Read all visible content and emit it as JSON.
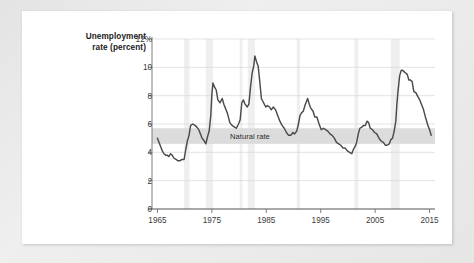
{
  "figure": {
    "y_axis_title_line1": "Unemployment",
    "y_axis_title_line2": "rate (percent)",
    "natural_rate_label": "Natural rate"
  },
  "colors": {
    "page_background": "#e9e9e9",
    "card_background": "#ffffff",
    "line": "#4a4a4a",
    "gridline": "#d8d8d8",
    "axis": "#6f6f6f",
    "natural_rate_band": "#dcdcdc",
    "recession_band": "#efefef",
    "tick_text": "#3c3c3c",
    "title_text": "#1a1a1a"
  },
  "chart_data": {
    "type": "line",
    "title": "",
    "subtitle": "",
    "xlabel": "",
    "ylabel": "Unemployment rate (percent)",
    "xlim": [
      1964,
      2016
    ],
    "ylim": [
      0,
      12
    ],
    "grid": true,
    "legend_position": "none",
    "y_ticks": [
      0,
      2,
      4,
      6,
      8,
      10,
      12
    ],
    "y_tick_labels": [
      "0",
      "2",
      "4",
      "6",
      "8",
      "10",
      "12%"
    ],
    "x_ticks": [
      1965,
      1975,
      1985,
      1995,
      2005,
      2015
    ],
    "x_tick_labels": [
      "1965",
      "1975",
      "1985",
      "1995",
      "2005",
      "2015"
    ],
    "annotations": [
      {
        "text": "Natural rate",
        "x": 1982.0,
        "y": 5.15,
        "kind": "band-label"
      }
    ],
    "bands": {
      "natural_rate": {
        "y_low": 4.6,
        "y_high": 5.7,
        "label": "Natural rate"
      },
      "recessions": [
        {
          "start": 1969.9,
          "end": 1970.9
        },
        {
          "start": 1973.9,
          "end": 1975.2
        },
        {
          "start": 1980.1,
          "end": 1980.6
        },
        {
          "start": 1981.6,
          "end": 1982.9
        },
        {
          "start": 1990.6,
          "end": 1991.2
        },
        {
          "start": 2001.2,
          "end": 2001.9
        },
        {
          "start": 2007.9,
          "end": 2009.5
        }
      ]
    },
    "series": [
      {
        "name": "Unemployment rate",
        "x": [
          1965.0,
          1965.3,
          1965.6,
          1965.9,
          1966.2,
          1966.5,
          1966.8,
          1967.1,
          1967.4,
          1967.7,
          1968.0,
          1968.4,
          1968.8,
          1969.1,
          1969.5,
          1969.9,
          1970.2,
          1970.5,
          1970.8,
          1971.1,
          1971.5,
          1971.9,
          1972.2,
          1972.6,
          1972.9,
          1973.2,
          1973.6,
          1973.9,
          1974.2,
          1974.5,
          1974.8,
          1975.0,
          1975.2,
          1975.5,
          1975.8,
          1976.1,
          1976.5,
          1976.9,
          1977.2,
          1977.6,
          1977.9,
          1978.3,
          1978.7,
          1979.1,
          1979.5,
          1979.9,
          1980.2,
          1980.5,
          1980.8,
          1981.1,
          1981.5,
          1981.8,
          1982.1,
          1982.4,
          1982.7,
          1982.9,
          1983.2,
          1983.5,
          1983.8,
          1984.1,
          1984.5,
          1984.9,
          1985.2,
          1985.6,
          1985.9,
          1986.3,
          1986.7,
          1987.1,
          1987.5,
          1987.9,
          1988.3,
          1988.7,
          1989.1,
          1989.5,
          1989.9,
          1990.2,
          1990.6,
          1990.9,
          1991.2,
          1991.5,
          1991.8,
          1992.1,
          1992.4,
          1992.6,
          1992.9,
          1993.2,
          1993.6,
          1993.9,
          1994.3,
          1994.7,
          1995.1,
          1995.5,
          1995.9,
          1996.3,
          1996.7,
          1997.1,
          1997.5,
          1997.9,
          1998.3,
          1998.7,
          1999.1,
          1999.5,
          1999.9,
          2000.3,
          2000.7,
          2001.0,
          2001.3,
          2001.6,
          2001.9,
          2002.2,
          2002.6,
          2002.9,
          2003.2,
          2003.5,
          2003.8,
          2004.1,
          2004.5,
          2004.9,
          2005.3,
          2005.7,
          2006.1,
          2006.5,
          2006.9,
          2007.2,
          2007.6,
          2007.9,
          2008.2,
          2008.5,
          2008.8,
          2009.0,
          2009.2,
          2009.5,
          2009.8,
          2010.0,
          2010.3,
          2010.6,
          2010.9,
          2011.2,
          2011.5,
          2011.8,
          2012.1,
          2012.5,
          2012.9,
          2013.2,
          2013.6,
          2013.9,
          2014.3,
          2014.7,
          2015.0,
          2015.3
        ],
        "y": [
          5.0,
          4.7,
          4.4,
          4.1,
          3.9,
          3.8,
          3.8,
          3.7,
          3.9,
          3.8,
          3.6,
          3.5,
          3.4,
          3.4,
          3.5,
          3.5,
          4.2,
          4.8,
          5.2,
          5.9,
          6.0,
          5.9,
          5.8,
          5.6,
          5.3,
          5.0,
          4.8,
          4.6,
          5.1,
          5.5,
          6.6,
          8.1,
          8.9,
          8.6,
          8.4,
          7.7,
          7.5,
          7.8,
          7.4,
          7.0,
          6.7,
          6.1,
          5.9,
          5.8,
          5.7,
          6.0,
          6.3,
          7.5,
          7.7,
          7.4,
          7.2,
          7.4,
          8.6,
          9.6,
          10.1,
          10.8,
          10.4,
          10.1,
          9.0,
          7.8,
          7.5,
          7.2,
          7.3,
          7.2,
          7.0,
          7.2,
          7.0,
          6.6,
          6.2,
          5.9,
          5.7,
          5.4,
          5.2,
          5.2,
          5.4,
          5.3,
          5.5,
          6.0,
          6.6,
          6.8,
          6.9,
          7.3,
          7.6,
          7.8,
          7.4,
          7.1,
          6.9,
          6.5,
          6.5,
          6.0,
          5.6,
          5.7,
          5.6,
          5.5,
          5.3,
          5.2,
          5.0,
          4.7,
          4.6,
          4.5,
          4.3,
          4.3,
          4.1,
          4.0,
          3.9,
          4.2,
          4.4,
          4.7,
          5.3,
          5.7,
          5.8,
          5.9,
          5.9,
          6.2,
          6.1,
          5.7,
          5.6,
          5.4,
          5.3,
          5.0,
          4.8,
          4.7,
          4.5,
          4.5,
          4.6,
          4.9,
          5.0,
          5.5,
          6.2,
          7.4,
          8.3,
          9.4,
          9.8,
          9.8,
          9.7,
          9.6,
          9.5,
          9.1,
          9.1,
          9.0,
          8.3,
          8.2,
          7.9,
          7.7,
          7.3,
          7.0,
          6.4,
          5.9,
          5.6,
          5.2
        ]
      }
    ]
  }
}
